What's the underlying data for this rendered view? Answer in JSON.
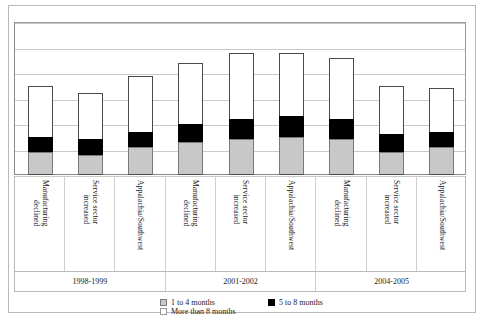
{
  "chart_data": {
    "type": "bar",
    "subtype": "stacked-column",
    "title": "",
    "xlabel": "",
    "ylabel": "",
    "ylim": [
      0,
      60
    ],
    "grid": true,
    "gridline_values": [
      0,
      10,
      20,
      30,
      40,
      50,
      60
    ],
    "legend_position": "bottom",
    "categories": [
      "Manufacturing declined",
      "Service sector increased",
      "Appalachia/Southwest",
      "Manufacturing declined",
      "Service sector increased",
      "Appalachia/Southwest",
      "Manufacturing declined",
      "Service sector increased",
      "Appalachia/Southwest"
    ],
    "category_lines": [
      [
        "Manufacturing",
        "declined"
      ],
      [
        "Service sector",
        "increased"
      ],
      [
        "Appalachia/Southwest"
      ],
      [
        "Manufacturing",
        "declined"
      ],
      [
        "Service sector",
        "increased"
      ],
      [
        "Appalachia/Southwest"
      ],
      [
        "Manufacturing",
        "declined"
      ],
      [
        "Service sector",
        "increased"
      ],
      [
        "Appalachia/Southwest"
      ]
    ],
    "groups": [
      {
        "label": "1998-1999",
        "span": 3
      },
      {
        "label": "2001-2002",
        "span": 3
      },
      {
        "label": "2004-2005",
        "span": 3
      }
    ],
    "series": [
      {
        "name": "1 to 4 months",
        "color": "#c8c8c8",
        "values": [
          9,
          8,
          11,
          13,
          14,
          15,
          14,
          9,
          11
        ]
      },
      {
        "name": "5 to 8 months",
        "color": "#000000",
        "values": [
          6,
          6,
          6,
          7,
          8,
          8,
          8,
          7,
          6
        ]
      },
      {
        "name": "More than 8 months",
        "color": "#ffffff",
        "values": [
          20,
          18,
          22,
          24,
          26,
          25,
          24,
          19,
          17
        ]
      }
    ],
    "totals": [
      35,
      32,
      39,
      44,
      48,
      48,
      46,
      35,
      34
    ]
  },
  "legend": {
    "items": [
      {
        "label": "1 to 4 months",
        "swatch": "gray"
      },
      {
        "label": "More than 8 months",
        "swatch": "white"
      },
      {
        "label": "5 to 8 months",
        "swatch": "black"
      }
    ]
  }
}
